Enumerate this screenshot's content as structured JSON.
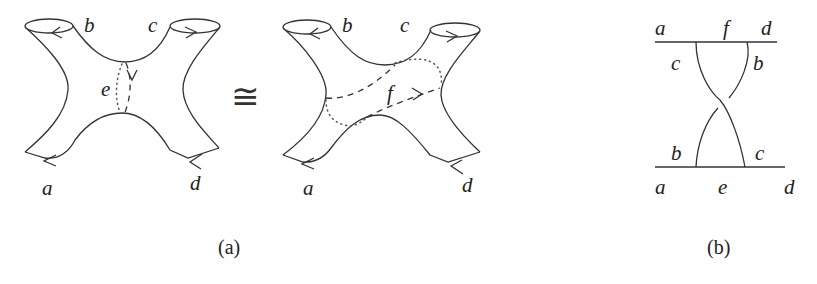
{
  "figure": {
    "panel_a": {
      "caption": "(a)",
      "left_surface": {
        "boundary_labels": {
          "top_left": "b",
          "top_right": "c",
          "bottom_left": "a",
          "bottom_right": "d"
        },
        "neck_label": "e"
      },
      "relation_symbol": "≅",
      "right_surface": {
        "boundary_labels": {
          "top_left": "b",
          "top_right": "c",
          "bottom_left": "a",
          "bottom_right": "d"
        },
        "curve_label": "f"
      }
    },
    "panel_b": {
      "caption": "(b)",
      "top_line_labels": {
        "left": "a",
        "middle": "f",
        "right": "d"
      },
      "top_strand_labels": {
        "left": "c",
        "right": "b"
      },
      "bottom_strand_labels": {
        "left": "b",
        "right": "c"
      },
      "bottom_line_labels": {
        "left": "a",
        "middle": "e",
        "right": "d"
      }
    }
  }
}
